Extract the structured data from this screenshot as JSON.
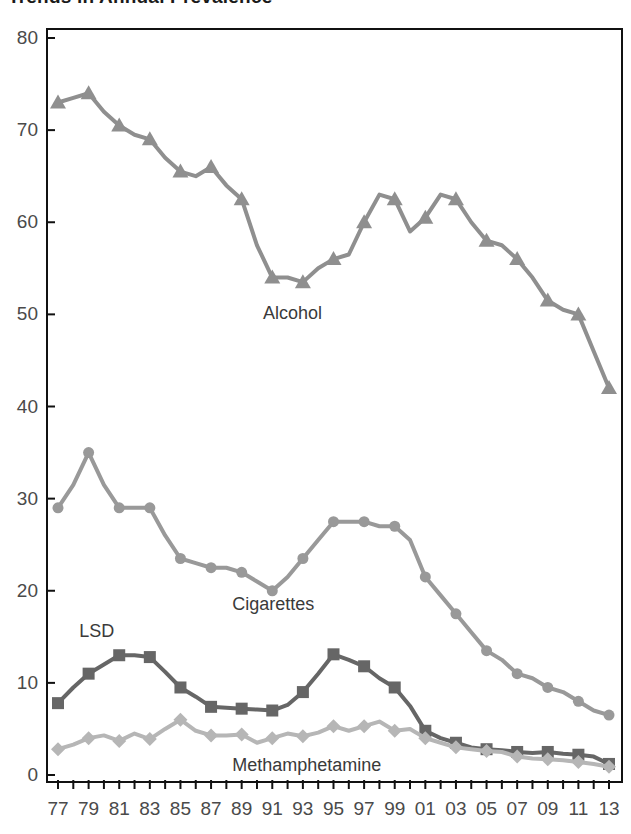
{
  "chart_data": {
    "type": "line",
    "title": "Trends in Annual Prevalence",
    "xlabel": "",
    "ylabel": "",
    "x": [
      "77",
      "78",
      "79",
      "80",
      "81",
      "82",
      "83",
      "84",
      "85",
      "86",
      "87",
      "88",
      "89",
      "90",
      "91",
      "92",
      "93",
      "94",
      "95",
      "96",
      "97",
      "98",
      "99",
      "00",
      "01",
      "02",
      "03",
      "04",
      "05",
      "06",
      "07",
      "08",
      "09",
      "10",
      "11",
      "12",
      "13"
    ],
    "xtick_labels": [
      "77",
      "79",
      "81",
      "83",
      "85",
      "87",
      "89",
      "91",
      "93",
      "95",
      "97",
      "99",
      "01",
      "03",
      "05",
      "07",
      "09",
      "11",
      "13"
    ],
    "ylim": [
      0,
      80
    ],
    "yticks": [
      0,
      10,
      20,
      30,
      40,
      50,
      60,
      70,
      80
    ],
    "grid": false,
    "legend": "inline-labels",
    "series": [
      {
        "name": "Alcohol",
        "color": "#8f8f8f",
        "marker": "triangle",
        "label_x": "93",
        "label_y": 50,
        "values": [
          73.0,
          73.5,
          74.0,
          72.0,
          70.5,
          69.5,
          69.0,
          67.0,
          65.5,
          65.0,
          66.0,
          64.0,
          62.5,
          57.5,
          54.0,
          54.0,
          53.5,
          55.0,
          56.0,
          56.5,
          60.0,
          63.0,
          62.5,
          59.0,
          60.5,
          63.0,
          62.5,
          60.0,
          58.0,
          57.5,
          56.0,
          54.0,
          51.5,
          50.5,
          50.0,
          46.0,
          42.0
        ]
      },
      {
        "name": "Cigarettes",
        "color": "#999999",
        "marker": "circle",
        "label_x": "91",
        "label_y": 18.5,
        "values": [
          29.0,
          31.5,
          35.0,
          31.5,
          29.0,
          29.0,
          29.0,
          26.0,
          23.5,
          23.0,
          22.5,
          22.5,
          22.0,
          21.0,
          20.0,
          21.5,
          23.5,
          25.5,
          27.5,
          27.5,
          27.5,
          27.0,
          27.0,
          25.5,
          21.5,
          19.5,
          17.5,
          15.5,
          13.5,
          12.5,
          11.0,
          10.5,
          9.5,
          9.0,
          8.0,
          7.0,
          6.5
        ]
      },
      {
        "name": "LSD",
        "color": "#666666",
        "marker": "square",
        "label_x": "81",
        "label_y": 15.5,
        "values": [
          7.8,
          9.5,
          11.0,
          12.0,
          13.0,
          13.0,
          12.8,
          11.2,
          9.5,
          8.5,
          7.4,
          7.3,
          7.2,
          7.1,
          7.0,
          7.6,
          9.0,
          11.0,
          13.1,
          12.5,
          11.8,
          10.5,
          9.5,
          7.5,
          4.8,
          4.0,
          3.5,
          3.0,
          2.8,
          2.7,
          2.5,
          2.4,
          2.5,
          2.3,
          2.2,
          2.0,
          1.2
        ]
      },
      {
        "name": "Methamphetamine",
        "color": "#b6b6b6",
        "marker": "diamond",
        "label_x": "91",
        "label_y": 1.0,
        "values": [
          2.8,
          3.3,
          4.0,
          4.3,
          3.7,
          4.5,
          3.9,
          5.0,
          6.0,
          4.8,
          4.3,
          4.3,
          4.4,
          3.5,
          4.0,
          4.5,
          4.2,
          4.6,
          5.3,
          4.8,
          5.3,
          5.8,
          4.8,
          5.0,
          4.0,
          3.5,
          3.0,
          2.8,
          2.6,
          2.5,
          2.0,
          1.8,
          1.7,
          1.6,
          1.4,
          1.2,
          0.9
        ]
      }
    ]
  }
}
